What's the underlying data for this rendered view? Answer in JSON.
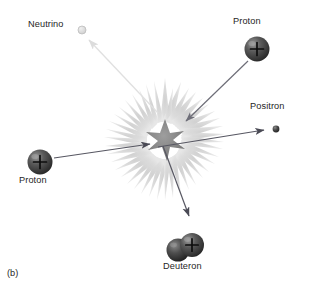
{
  "figure": {
    "panel_label": "(b)",
    "caption_text": "",
    "background_color": "#ffffff"
  },
  "diagram": {
    "type": "proton-proton-fusion-reaction",
    "burst": {
      "name": "reaction-burst",
      "center_x": 165,
      "center_y": 140,
      "outer_color": "#d9d9d9",
      "inner_color": "#8f8f8f",
      "outer_radius": 62,
      "inner_radius": 20
    },
    "particles": [
      {
        "id": "neutrino",
        "label": "Neutrino",
        "kind": "neutrino",
        "charge": "",
        "cx": 82,
        "cy": 30,
        "radius": 4.0,
        "fill": "#dcdcdc",
        "stroke": "#b5b5b5",
        "label_x": 28,
        "label_y": 25
      },
      {
        "id": "proton-top-right",
        "label": "Proton",
        "kind": "proton",
        "charge": "+",
        "cx": 257,
        "cy": 49,
        "radius": 12.5,
        "fill": "#3d3d3d",
        "stroke": "#1f1f1f",
        "label_x": 233,
        "label_y": 22
      },
      {
        "id": "positron",
        "label": "Positron",
        "kind": "positron",
        "charge": "",
        "cx": 276,
        "cy": 129,
        "radius": 3.4,
        "fill": "#3d3d3d",
        "stroke": "#1f1f1f",
        "label_x": 250,
        "label_y": 106
      },
      {
        "id": "proton-left",
        "label": "Proton",
        "kind": "proton",
        "charge": "+",
        "cx": 40,
        "cy": 162,
        "radius": 12.5,
        "fill": "#3d3d3d",
        "stroke": "#1f1f1f",
        "label_x": 19,
        "label_y": 176
      },
      {
        "id": "deuteron",
        "label": "Deuteron",
        "kind": "deuteron",
        "charge": "+",
        "cx": 186,
        "cy": 248,
        "radius": 12.5,
        "fill": "#3d3d3d",
        "stroke": "#1f1f1f",
        "label_x": 163,
        "label_y": 264
      }
    ],
    "arrows": [
      {
        "id": "arrow-neutrino-out",
        "name": "neutrino-arrow",
        "from_x": 158,
        "from_y": 113,
        "to_x": 87,
        "to_y": 38,
        "color": "#e2e2e2",
        "width": 1.2,
        "direction": "out"
      },
      {
        "id": "arrow-proton-top-right-in",
        "name": "proton-top-right-arrow",
        "from_x": 248,
        "from_y": 61,
        "to_x": 184,
        "to_y": 122,
        "color": "#6e6e78",
        "width": 1.2,
        "direction": "in"
      },
      {
        "id": "arrow-proton-left-in",
        "name": "proton-left-arrow",
        "from_x": 54,
        "from_y": 158,
        "to_x": 148,
        "to_y": 144,
        "color": "#575762",
        "width": 1.2,
        "direction": "in"
      },
      {
        "id": "arrow-positron-out",
        "name": "positron-arrow",
        "from_x": 160,
        "from_y": 146,
        "to_x": 265,
        "to_y": 130,
        "color": "#575762",
        "width": 1.2,
        "direction": "out"
      },
      {
        "id": "arrow-deuteron-out",
        "name": "deuteron-arrow",
        "from_x": 164,
        "from_y": 146,
        "to_x": 190,
        "to_y": 218,
        "color": "#575762",
        "width": 1.2,
        "direction": "out"
      }
    ]
  }
}
